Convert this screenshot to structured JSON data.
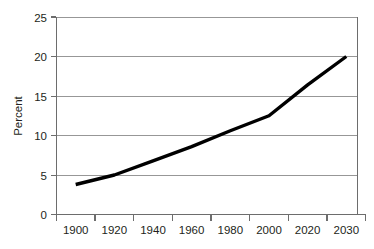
{
  "chart_data": {
    "type": "line",
    "title": "",
    "xlabel": "",
    "ylabel": "Percent",
    "grid": "horizontal",
    "legend": "none",
    "xlim": [
      1900,
      2030
    ],
    "ylim": [
      0,
      25
    ],
    "x_tick_labels": [
      "1900",
      "1920",
      "1940",
      "1960",
      "1980",
      "2000",
      "2020",
      "2030"
    ],
    "y_tick_labels": [
      "0",
      "5",
      "10",
      "15",
      "20",
      "25"
    ],
    "y_ticks": [
      0,
      5,
      10,
      15,
      20,
      25
    ],
    "categories": [
      1900,
      1920,
      1940,
      1960,
      1980,
      2000,
      2020,
      2030
    ],
    "series": [
      {
        "name": "Percent",
        "color": "#000000",
        "values": [
          3.8,
          5.0,
          6.8,
          8.6,
          10.6,
          12.5,
          16.4,
          20.0
        ]
      }
    ]
  },
  "axes": {
    "y_axis_title": "Percent",
    "y_tick_0": "0",
    "y_tick_5": "5",
    "y_tick_10": "10",
    "y_tick_15": "15",
    "y_tick_20": "20",
    "y_tick_25": "25",
    "x_tick_1900": "1900",
    "x_tick_1920": "1920",
    "x_tick_1940": "1940",
    "x_tick_1960": "1960",
    "x_tick_1980": "1980",
    "x_tick_2000": "2000",
    "x_tick_2020": "2020",
    "x_tick_2030": "2030"
  }
}
